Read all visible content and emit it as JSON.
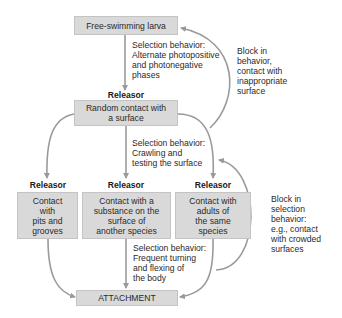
{
  "colors": {
    "box_fill": "#d9d9d9",
    "arrow": "#9a9a9a",
    "text": "#2a2a2a"
  },
  "nodes": {
    "larva": "Free-swimming larva",
    "random_contact": "Random contact with\na surface",
    "pits": "Contact\nwith\npits and\ngrooves",
    "substance": "Contact with a\nsubstance on the\nsurface of\nanother species",
    "adults": "Contact with\nadults of\nthe same\nspecies",
    "attachment": "ATTACHMENT"
  },
  "releasor_label": "Releasor",
  "annotations": {
    "selection1": "Selection behavior:\nAlternate photopositive\nand photonegative\nphases",
    "selection2": "Selection behavior:\nCrawling and\ntesting the surface",
    "selection3": "Selection behavior:\nFrequent turning\nand flexing of\nthe body",
    "block1": "Block in\nbehavior,\ncontact with\ninappropriate\nsurface",
    "block2": "Block in\nselection\nbehavior:\ne.g., contact\nwith crowded\nsurfaces"
  }
}
